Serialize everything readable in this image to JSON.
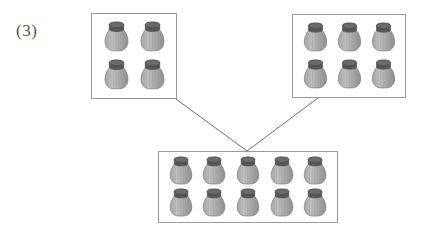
{
  "page": {
    "background_color": "#ffffff",
    "width": 431,
    "height": 247
  },
  "problem_label": "(3)",
  "diagram": {
    "kind": "part-part-whole-jar-grouping",
    "jar_icon_name": "jar-icon",
    "colors": {
      "jar_lid": "#5a5a5a",
      "jar_body": "#a8a8a8",
      "jar_body_light": "#c0c0c0",
      "jar_stripe": "#999999",
      "box_border": "#9a9a9a",
      "connector_line": "#6d6d6d",
      "label_text": "#555555"
    },
    "groups": [
      {
        "id": "top-left",
        "name": "top-left-group",
        "jar_count": 4,
        "rows": 2,
        "columns": 2,
        "x": 91,
        "y": 13,
        "width": 86,
        "height": 86
      },
      {
        "id": "top-right",
        "name": "top-right-group",
        "jar_count": 6,
        "rows": 2,
        "columns": 3,
        "x": 292,
        "y": 14,
        "width": 114,
        "height": 84
      },
      {
        "id": "bottom",
        "name": "bottom-total-group",
        "jar_count": 10,
        "rows": 2,
        "columns": 5,
        "x": 158,
        "y": 151,
        "width": 180,
        "height": 72
      }
    ],
    "connectors": [
      {
        "name": "connector-left",
        "from": "top-left",
        "to": "bottom",
        "x1": 176,
        "y1": 99,
        "x2": 247,
        "y2": 151
      },
      {
        "name": "connector-right",
        "from": "top-right",
        "to": "bottom",
        "x1": 318,
        "y1": 98,
        "x2": 247,
        "y2": 151
      }
    ]
  }
}
